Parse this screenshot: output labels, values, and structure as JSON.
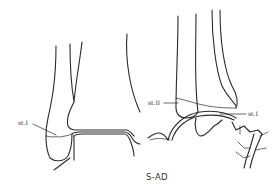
{
  "figure": {
    "caption": "S-AD",
    "views": [
      {
        "name": "anteroposterior-view",
        "labels": [
          {
            "text": "st.I"
          }
        ]
      },
      {
        "name": "lateral-view",
        "labels": [
          {
            "text": "st.II"
          },
          {
            "text": "st.I"
          }
        ]
      }
    ],
    "line_color": "#2a2a2a",
    "background": "#ffffff"
  }
}
